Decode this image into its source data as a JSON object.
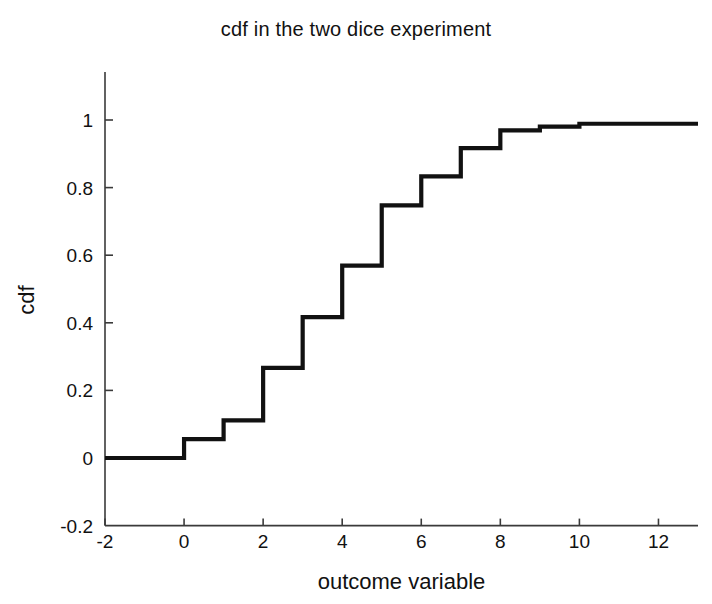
{
  "chart_data": {
    "type": "line",
    "title": "cdf in the two dice experiment",
    "xlabel": "outcome variable",
    "ylabel": "cdf",
    "xlim": [
      -2,
      13
    ],
    "ylim": [
      -0.2,
      1.12
    ],
    "xticks": [
      -2,
      0,
      2,
      4,
      6,
      8,
      10,
      12
    ],
    "xtick_labels": [
      "-2",
      "0",
      "2",
      "4",
      "6",
      "8",
      "10",
      "12"
    ],
    "yticks": [
      -0.2,
      0,
      0.2,
      0.4,
      0.6,
      0.8,
      1
    ],
    "ytick_labels": [
      "-0.2",
      "0",
      "0.2",
      "0.4",
      "0.6",
      "0.8",
      "1"
    ],
    "grid": false,
    "legend": null,
    "style": "step-post",
    "series": [
      {
        "name": "cdf",
        "color": "#111111",
        "line_width": 4.2,
        "x": [
          -2,
          0,
          1,
          2,
          3,
          4,
          5,
          6,
          7,
          8,
          9,
          10,
          13
        ],
        "y": [
          0,
          0.0556,
          0.1111,
          0.2667,
          0.4167,
          0.5694,
          0.7472,
          0.8333,
          0.9167,
          0.9694,
          0.9806,
          0.9889,
          0.9889
        ],
        "steps": [
          {
            "x": -2,
            "cdf": 0
          },
          {
            "x": 0,
            "cdf": 0.0556
          },
          {
            "x": 1,
            "cdf": 0.1111
          },
          {
            "x": 2,
            "cdf": 0.2667
          },
          {
            "x": 3,
            "cdf": 0.4167
          },
          {
            "x": 4,
            "cdf": 0.5694
          },
          {
            "x": 5,
            "cdf": 0.7472
          },
          {
            "x": 6,
            "cdf": 0.8333
          },
          {
            "x": 7,
            "cdf": 0.9167
          },
          {
            "x": 8,
            "cdf": 0.9694
          },
          {
            "x": 9,
            "cdf": 0.9806
          },
          {
            "x": 10,
            "cdf": 0.9889
          }
        ]
      }
    ]
  },
  "colors": {
    "curve": "#111111",
    "axis": "#3a3a3a",
    "background": "#ffffff",
    "text": "#111111"
  }
}
